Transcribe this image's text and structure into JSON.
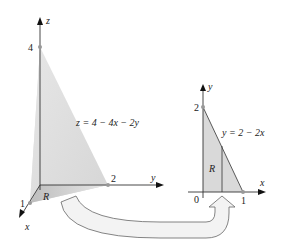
{
  "diagram": {
    "colors": {
      "region_fill": "#dcdcdc",
      "region_shade": "#c8c8c8",
      "axis": "#333333",
      "point": "#999999",
      "arrow_fill": "#f2f2f2",
      "arrow_stroke": "#666666"
    },
    "three_d": {
      "axis_z_label": "z",
      "axis_y_label": "y",
      "axis_x_label": "x",
      "z_intercept_label": "4",
      "y_intercept_label": "2",
      "x_intercept_label": "1",
      "surface_equation": "z = 4 − 4x − 2y",
      "region_label": "R"
    },
    "two_d": {
      "axis_y_label": "y",
      "axis_x_label": "x",
      "origin_label": "0",
      "y_intercept_label": "2",
      "x_intercept_label": "1",
      "line_equation": "y = 2 − 2x",
      "region_label": "R"
    }
  }
}
